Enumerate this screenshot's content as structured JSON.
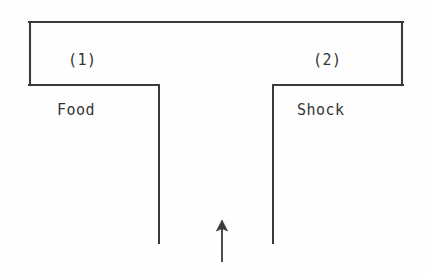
{
  "figure": {
    "type": "t-maze-diagram",
    "background_color": "#fefefe",
    "line_color": "#3a3a3a",
    "text_color": "#353535"
  },
  "arms": [
    {
      "number_label": "(1)",
      "contents_label": "Food",
      "side": "left"
    },
    {
      "number_label": "(2)",
      "contents_label": "Shock",
      "side": "right"
    }
  ],
  "start_arrow": {
    "name": "start-arrow",
    "direction": "up",
    "label": ""
  }
}
